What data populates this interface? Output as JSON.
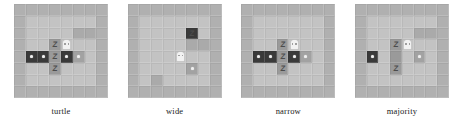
{
  "figure": {
    "background": "#ffffff",
    "panel_count": 4,
    "grid_size": 8
  },
  "palette": {
    "floor": "#c3c3c3",
    "wall": "#b0b0b0",
    "dark_tile": "#3a3a3a",
    "mid_tile": "#9a9a9a",
    "sprite_light": "#f2f2f2",
    "glyph": "#4c4c4c",
    "caption": "#1a1a1a"
  },
  "sprites": {
    "treasure": "dot-sprite",
    "enemy": "z-glyph-sprite",
    "player": "hero-avatar-sprite",
    "enemy_glyph": "Z"
  },
  "panels": [
    {
      "label": "turtle",
      "name": "panel-turtle",
      "tiles": [
        [
          "wall",
          "wall",
          "wall",
          "wall",
          "wall",
          "wall",
          "wall",
          "wall"
        ],
        [
          "wall",
          "floor",
          "floor",
          "floor",
          "floor",
          "floor",
          "floor",
          "wall"
        ],
        [
          "wall",
          "floor",
          "floor",
          "floor",
          "floor",
          "wall2",
          "wall2",
          "wall"
        ],
        [
          "wall",
          "floor",
          "floor",
          "mid",
          "hero",
          "floor",
          "floor",
          "wall"
        ],
        [
          "wall",
          "dark",
          "dark",
          "mid",
          "dark",
          "mid2",
          "floor",
          "wall"
        ],
        [
          "wall",
          "floor",
          "floor",
          "mid",
          "floor",
          "floor",
          "floor",
          "wall"
        ],
        [
          "wall",
          "floor",
          "floor",
          "floor",
          "floor",
          "floor",
          "floor",
          "wall"
        ],
        [
          "wall",
          "wall",
          "wall",
          "wall",
          "wall",
          "wall",
          "wall",
          "wall"
        ]
      ],
      "sprites": [
        {
          "row": 3,
          "col": 3,
          "kind": "enemy"
        },
        {
          "row": 3,
          "col": 4,
          "kind": "player"
        },
        {
          "row": 4,
          "col": 1,
          "kind": "treasure"
        },
        {
          "row": 4,
          "col": 2,
          "kind": "treasure"
        },
        {
          "row": 4,
          "col": 3,
          "kind": "enemy"
        },
        {
          "row": 4,
          "col": 4,
          "kind": "treasure"
        },
        {
          "row": 4,
          "col": 5,
          "kind": "treasure"
        },
        {
          "row": 5,
          "col": 3,
          "kind": "enemy"
        }
      ]
    },
    {
      "label": "wide",
      "name": "panel-wide",
      "tiles": [
        [
          "wall",
          "wall",
          "wall",
          "wall",
          "wall",
          "wall",
          "wall",
          "wall"
        ],
        [
          "wall",
          "floor",
          "floor",
          "floor",
          "floor",
          "floor",
          "floor",
          "wall"
        ],
        [
          "wall",
          "floor",
          "floor",
          "floor",
          "floor",
          "dark",
          "floor",
          "wall"
        ],
        [
          "wall",
          "floor",
          "floor",
          "floor",
          "floor",
          "wall2",
          "wall2",
          "wall"
        ],
        [
          "wall",
          "floor",
          "floor",
          "floor",
          "hero",
          "floor",
          "floor",
          "wall"
        ],
        [
          "wall",
          "floor",
          "floor",
          "floor",
          "floor",
          "mid2",
          "floor",
          "wall"
        ],
        [
          "wall",
          "floor",
          "wall2",
          "floor",
          "floor",
          "floor",
          "floor",
          "wall"
        ],
        [
          "wall",
          "wall",
          "wall",
          "wall",
          "wall",
          "wall",
          "wall",
          "wall"
        ]
      ],
      "sprites": [
        {
          "row": 2,
          "col": 5,
          "kind": "enemy"
        },
        {
          "row": 4,
          "col": 4,
          "kind": "player"
        },
        {
          "row": 5,
          "col": 5,
          "kind": "treasure"
        }
      ]
    },
    {
      "label": "narrow",
      "name": "panel-narrow",
      "tiles": [
        [
          "wall",
          "wall",
          "wall",
          "wall",
          "wall",
          "wall",
          "wall",
          "wall"
        ],
        [
          "wall",
          "floor",
          "floor",
          "floor",
          "floor",
          "floor",
          "floor",
          "wall"
        ],
        [
          "wall",
          "floor",
          "floor",
          "floor",
          "floor",
          "floor",
          "floor",
          "wall"
        ],
        [
          "wall",
          "floor",
          "floor",
          "mid",
          "hero",
          "floor",
          "floor",
          "wall"
        ],
        [
          "wall",
          "dark",
          "dark",
          "mid",
          "dark",
          "mid2",
          "floor",
          "wall"
        ],
        [
          "wall",
          "floor",
          "floor",
          "mid",
          "floor",
          "floor",
          "floor",
          "wall"
        ],
        [
          "wall",
          "floor",
          "floor",
          "floor",
          "floor",
          "floor",
          "floor",
          "wall"
        ],
        [
          "wall",
          "wall",
          "wall",
          "wall",
          "wall",
          "wall",
          "wall",
          "wall"
        ]
      ],
      "sprites": [
        {
          "row": 3,
          "col": 3,
          "kind": "enemy"
        },
        {
          "row": 3,
          "col": 4,
          "kind": "player"
        },
        {
          "row": 4,
          "col": 1,
          "kind": "treasure"
        },
        {
          "row": 4,
          "col": 2,
          "kind": "treasure"
        },
        {
          "row": 4,
          "col": 3,
          "kind": "enemy"
        },
        {
          "row": 4,
          "col": 4,
          "kind": "treasure"
        },
        {
          "row": 4,
          "col": 5,
          "kind": "treasure"
        },
        {
          "row": 5,
          "col": 3,
          "kind": "enemy"
        }
      ]
    },
    {
      "label": "majority",
      "name": "panel-majority",
      "tiles": [
        [
          "wall",
          "wall",
          "wall",
          "wall",
          "wall",
          "wall",
          "wall",
          "wall"
        ],
        [
          "wall",
          "floor",
          "floor",
          "floor",
          "floor",
          "floor",
          "floor",
          "wall"
        ],
        [
          "wall",
          "floor",
          "floor",
          "floor",
          "floor",
          "wall2",
          "wall2",
          "wall"
        ],
        [
          "wall",
          "floor",
          "floor",
          "mid",
          "hero",
          "floor",
          "floor",
          "wall"
        ],
        [
          "wall",
          "dark",
          "floor",
          "mid",
          "floor",
          "mid2",
          "floor",
          "wall"
        ],
        [
          "wall",
          "floor",
          "floor",
          "mid",
          "floor",
          "floor",
          "floor",
          "wall"
        ],
        [
          "wall",
          "floor",
          "floor",
          "floor",
          "floor",
          "floor",
          "floor",
          "wall"
        ],
        [
          "wall",
          "wall",
          "wall",
          "wall",
          "wall",
          "wall",
          "wall",
          "wall"
        ]
      ],
      "sprites": [
        {
          "row": 3,
          "col": 3,
          "kind": "enemy"
        },
        {
          "row": 3,
          "col": 4,
          "kind": "player"
        },
        {
          "row": 4,
          "col": 1,
          "kind": "treasure"
        },
        {
          "row": 4,
          "col": 5,
          "kind": "treasure"
        },
        {
          "row": 5,
          "col": 3,
          "kind": "enemy"
        }
      ]
    }
  ]
}
